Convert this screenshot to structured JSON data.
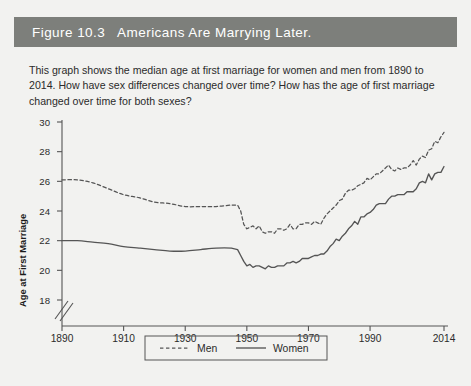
{
  "figure": {
    "title": "Figure 10.3   Americans Are Marrying Later.",
    "title_bg": "#7d7f7b",
    "page_bg": "#f2f2f0",
    "description": "This graph shows the median age at first marriage for women and men from 1890 to 2014. How have sex differences changed over time? How has the age of first marriage changed over time for both sexes?"
  },
  "chart_data": {
    "type": "line",
    "title": "",
    "xlabel": "",
    "ylabel": "Age at First Marriage",
    "xlim": [
      1890,
      2014
    ],
    "ylim": [
      17,
      30
    ],
    "ytick_start": 18,
    "ytick_end": 30,
    "ytick_step": 2,
    "yticks": [
      18,
      20,
      22,
      24,
      26,
      28,
      30
    ],
    "xticks": [
      1890,
      1910,
      1930,
      1950,
      1970,
      1990,
      2014
    ],
    "axis_break": true,
    "axis_break_note": "y-axis broken below 18",
    "grid": false,
    "legend_position": "bottom-center",
    "line_color": "#555555",
    "series": [
      {
        "name": "Men",
        "style": "dashed",
        "x": [
          1890,
          1895,
          1900,
          1905,
          1910,
          1915,
          1920,
          1925,
          1930,
          1935,
          1940,
          1945,
          1947,
          1948,
          1949,
          1950,
          1951,
          1952,
          1953,
          1954,
          1955,
          1956,
          1957,
          1958,
          1959,
          1960,
          1961,
          1962,
          1963,
          1964,
          1965,
          1966,
          1967,
          1968,
          1969,
          1970,
          1971,
          1972,
          1973,
          1974,
          1975,
          1976,
          1977,
          1978,
          1979,
          1980,
          1981,
          1982,
          1983,
          1984,
          1985,
          1986,
          1987,
          1988,
          1989,
          1990,
          1991,
          1992,
          1993,
          1994,
          1995,
          1996,
          1997,
          1998,
          1999,
          2000,
          2001,
          2002,
          2003,
          2004,
          2005,
          2006,
          2007,
          2008,
          2009,
          2010,
          2011,
          2012,
          2013,
          2014
        ],
        "y": [
          26.1,
          26.1,
          25.9,
          25.5,
          25.1,
          24.9,
          24.6,
          24.5,
          24.3,
          24.3,
          24.3,
          24.4,
          24.4,
          24.0,
          23.1,
          22.8,
          22.9,
          23.0,
          22.8,
          23.0,
          22.6,
          22.5,
          22.6,
          22.6,
          22.5,
          22.8,
          22.8,
          22.7,
          22.8,
          23.1,
          22.8,
          22.8,
          23.1,
          23.1,
          23.2,
          23.2,
          23.1,
          23.3,
          23.2,
          23.1,
          23.5,
          23.8,
          24.0,
          24.2,
          24.4,
          24.7,
          24.8,
          25.2,
          25.4,
          25.4,
          25.5,
          25.7,
          25.8,
          25.9,
          26.2,
          26.1,
          26.3,
          26.5,
          26.5,
          26.7,
          26.9,
          27.1,
          26.8,
          26.7,
          26.9,
          26.8,
          26.9,
          26.9,
          27.1,
          27.4,
          27.1,
          27.5,
          27.7,
          27.6,
          28.1,
          28.2,
          28.7,
          28.6,
          29.0,
          29.3
        ]
      },
      {
        "name": "Women",
        "style": "solid",
        "x": [
          1890,
          1895,
          1900,
          1905,
          1910,
          1915,
          1920,
          1925,
          1930,
          1935,
          1940,
          1945,
          1947,
          1948,
          1949,
          1950,
          1951,
          1952,
          1953,
          1954,
          1955,
          1956,
          1957,
          1958,
          1959,
          1960,
          1961,
          1962,
          1963,
          1964,
          1965,
          1966,
          1967,
          1968,
          1969,
          1970,
          1971,
          1972,
          1973,
          1974,
          1975,
          1976,
          1977,
          1978,
          1979,
          1980,
          1981,
          1982,
          1983,
          1984,
          1985,
          1986,
          1987,
          1988,
          1989,
          1990,
          1991,
          1992,
          1993,
          1994,
          1995,
          1996,
          1997,
          1998,
          1999,
          2000,
          2001,
          2002,
          2003,
          2004,
          2005,
          2006,
          2007,
          2008,
          2009,
          2010,
          2011,
          2012,
          2013,
          2014
        ],
        "y": [
          22.0,
          22.0,
          21.9,
          21.8,
          21.6,
          21.5,
          21.4,
          21.3,
          21.3,
          21.4,
          21.5,
          21.5,
          21.4,
          21.0,
          20.6,
          20.3,
          20.4,
          20.2,
          20.3,
          20.3,
          20.2,
          20.1,
          20.3,
          20.2,
          20.2,
          20.3,
          20.3,
          20.3,
          20.5,
          20.5,
          20.6,
          20.5,
          20.6,
          20.8,
          20.8,
          20.8,
          20.9,
          21.0,
          21.0,
          21.1,
          21.1,
          21.3,
          21.6,
          21.8,
          22.1,
          22.0,
          22.3,
          22.5,
          22.8,
          23.0,
          23.3,
          23.1,
          23.6,
          23.6,
          23.8,
          23.9,
          24.1,
          24.4,
          24.5,
          24.5,
          24.5,
          24.8,
          25.0,
          25.0,
          25.1,
          25.1,
          25.1,
          25.3,
          25.3,
          25.3,
          25.5,
          25.9,
          26.0,
          25.9,
          26.5,
          26.1,
          26.5,
          26.6,
          26.6,
          27.0
        ]
      }
    ]
  },
  "legend": {
    "men_label": "Men",
    "women_label": "Women"
  }
}
